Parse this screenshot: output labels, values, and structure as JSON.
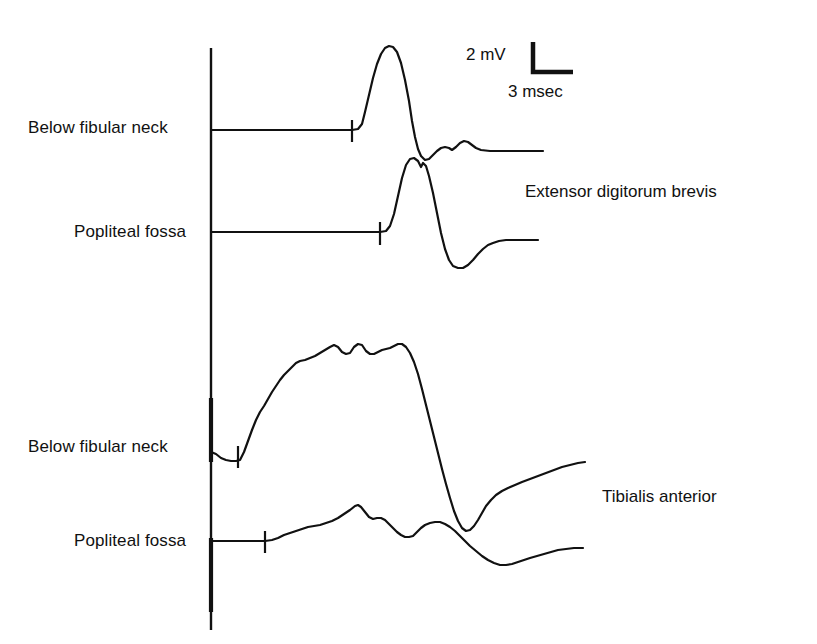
{
  "figure": {
    "type": "electromyography-waveform-figure",
    "background_color": "#ffffff",
    "ink_color": "#111111",
    "width": 817,
    "height": 644
  },
  "scale_bar": {
    "vertical_label": "2 mV",
    "horizontal_label": "3 msec",
    "vertical_amplitude_mV": 2,
    "horizontal_duration_msec": 3,
    "corner_x": 533,
    "corner_y": 72,
    "vertical_top_y": 42,
    "horizontal_right_x": 573
  },
  "axis": {
    "name": "vertical-reference-axis",
    "x": 211,
    "top_y": 48,
    "bottom_y": 630
  },
  "stimulation_site_labels": [
    {
      "text": "Below fibular neck",
      "x": 28,
      "y": 118,
      "trace": 1
    },
    {
      "text": "Popliteal fossa",
      "x": 74,
      "y": 222,
      "trace": 2
    },
    {
      "text": "Below fibular neck",
      "x": 28,
      "y": 437,
      "trace": 3
    },
    {
      "text": "Popliteal fossa",
      "x": 74,
      "y": 531,
      "trace": 4
    }
  ],
  "muscle_labels": [
    {
      "text": "Extensor digitorum brevis",
      "x": 525,
      "y": 182
    },
    {
      "text": "Tibialis anterior",
      "x": 602,
      "y": 487
    }
  ],
  "chart_data": {
    "type": "line",
    "title": "",
    "subtitle": "",
    "xlabel": "Time (msec)",
    "ylabel": "Amplitude (mV)",
    "grid": false,
    "legend_position": "right-inline",
    "axis_note": "Vertical reference line marks stimulus-onset time axis; each trace has its own baseline offset.",
    "calibration": {
      "mV_per_division": 2,
      "msec_per_division": 3
    },
    "series": [
      {
        "name": "Below fibular neck — Extensor digitorum brevis",
        "muscle": "Extensor digitorum brevis",
        "stimulation_site": "Below fibular neck",
        "baseline_y": 130,
        "stimulus_tick_x": 352,
        "stimulus_tick_top_y": 120,
        "stimulus_tick_bottom_y": 142,
        "points": [
          [
            211,
            130
          ],
          [
            250,
            130
          ],
          [
            300,
            130
          ],
          [
            340,
            130
          ],
          [
            352,
            130
          ],
          [
            358,
            129
          ],
          [
            362,
            124
          ],
          [
            365,
            112
          ],
          [
            369,
            95
          ],
          [
            373,
            78
          ],
          [
            377,
            64
          ],
          [
            381,
            54
          ],
          [
            385,
            48
          ],
          [
            389,
            46
          ],
          [
            393,
            47
          ],
          [
            397,
            52
          ],
          [
            401,
            63
          ],
          [
            405,
            80
          ],
          [
            409,
            101
          ],
          [
            412,
            121
          ],
          [
            415,
            137
          ],
          [
            418,
            149
          ],
          [
            421,
            156
          ],
          [
            425,
            160
          ],
          [
            429,
            159
          ],
          [
            433,
            155
          ],
          [
            437,
            151
          ],
          [
            441,
            148
          ],
          [
            445,
            147
          ],
          [
            449,
            148
          ],
          [
            452,
            150
          ],
          [
            456,
            147
          ],
          [
            460,
            143
          ],
          [
            464,
            141
          ],
          [
            468,
            142
          ],
          [
            472,
            145
          ],
          [
            476,
            148
          ],
          [
            481,
            150
          ],
          [
            490,
            151
          ],
          [
            505,
            151
          ],
          [
            520,
            151
          ],
          [
            543,
            151
          ]
        ]
      },
      {
        "name": "Popliteal fossa — Extensor digitorum brevis",
        "muscle": "Extensor digitorum brevis",
        "stimulation_site": "Popliteal fossa",
        "baseline_y": 232,
        "stimulus_tick_x": 380,
        "stimulus_tick_top_y": 222,
        "stimulus_tick_bottom_y": 245,
        "points": [
          [
            211,
            232
          ],
          [
            260,
            232
          ],
          [
            320,
            232
          ],
          [
            370,
            232
          ],
          [
            380,
            232
          ],
          [
            386,
            231
          ],
          [
            390,
            226
          ],
          [
            394,
            214
          ],
          [
            398,
            196
          ],
          [
            402,
            178
          ],
          [
            406,
            165
          ],
          [
            410,
            159
          ],
          [
            414,
            158
          ],
          [
            418,
            161
          ],
          [
            421,
            167
          ],
          [
            423,
            163
          ],
          [
            426,
            166
          ],
          [
            429,
            176
          ],
          [
            433,
            193
          ],
          [
            437,
            213
          ],
          [
            441,
            233
          ],
          [
            445,
            249
          ],
          [
            449,
            260
          ],
          [
            453,
            266
          ],
          [
            458,
            268
          ],
          [
            463,
            268
          ],
          [
            468,
            265
          ],
          [
            473,
            260
          ],
          [
            478,
            254
          ],
          [
            483,
            249
          ],
          [
            488,
            245
          ],
          [
            493,
            243
          ],
          [
            499,
            241
          ],
          [
            506,
            240
          ],
          [
            514,
            240
          ],
          [
            524,
            240
          ],
          [
            538,
            240
          ]
        ]
      },
      {
        "name": "Below fibular neck — Tibialis anterior",
        "muscle": "Tibialis anterior",
        "stimulation_site": "Below fibular neck",
        "baseline_y": 455,
        "stimulus_tick_x": 238,
        "stimulus_tick_top_y": 446,
        "stimulus_tick_bottom_y": 468,
        "points": [
          [
            211,
            452
          ],
          [
            216,
            454
          ],
          [
            221,
            458
          ],
          [
            226,
            460
          ],
          [
            231,
            461
          ],
          [
            236,
            461
          ],
          [
            240,
            460
          ],
          [
            244,
            452
          ],
          [
            248,
            441
          ],
          [
            252,
            430
          ],
          [
            256,
            420
          ],
          [
            260,
            412
          ],
          [
            264,
            406
          ],
          [
            268,
            399
          ],
          [
            272,
            392
          ],
          [
            276,
            386
          ],
          [
            280,
            380
          ],
          [
            284,
            375
          ],
          [
            288,
            371
          ],
          [
            292,
            367
          ],
          [
            296,
            363
          ],
          [
            300,
            361
          ],
          [
            305,
            360
          ],
          [
            310,
            358
          ],
          [
            315,
            356
          ],
          [
            320,
            353
          ],
          [
            325,
            350
          ],
          [
            330,
            347
          ],
          [
            334,
            345
          ],
          [
            338,
            347
          ],
          [
            342,
            352
          ],
          [
            346,
            354
          ],
          [
            350,
            353
          ],
          [
            354,
            347
          ],
          [
            358,
            344
          ],
          [
            362,
            345
          ],
          [
            366,
            351
          ],
          [
            370,
            354
          ],
          [
            374,
            354
          ],
          [
            378,
            352
          ],
          [
            382,
            350
          ],
          [
            386,
            349
          ],
          [
            390,
            348
          ],
          [
            394,
            346
          ],
          [
            398,
            344
          ],
          [
            402,
            344
          ],
          [
            406,
            347
          ],
          [
            410,
            353
          ],
          [
            414,
            362
          ],
          [
            418,
            374
          ],
          [
            422,
            389
          ],
          [
            426,
            405
          ],
          [
            430,
            421
          ],
          [
            434,
            437
          ],
          [
            438,
            453
          ],
          [
            442,
            469
          ],
          [
            446,
            484
          ],
          [
            450,
            498
          ],
          [
            454,
            511
          ],
          [
            458,
            521
          ],
          [
            462,
            528
          ],
          [
            466,
            531
          ],
          [
            470,
            530
          ],
          [
            474,
            526
          ],
          [
            478,
            520
          ],
          [
            482,
            513
          ],
          [
            486,
            506
          ],
          [
            491,
            500
          ],
          [
            496,
            495
          ],
          [
            502,
            491
          ],
          [
            508,
            488
          ],
          [
            515,
            485
          ],
          [
            522,
            482
          ],
          [
            530,
            479
          ],
          [
            538,
            476
          ],
          [
            546,
            473
          ],
          [
            554,
            470
          ],
          [
            562,
            467
          ],
          [
            570,
            465
          ],
          [
            578,
            463
          ],
          [
            585,
            462
          ]
        ]
      },
      {
        "name": "Popliteal fossa — Tibialis anterior",
        "muscle": "Tibialis anterior",
        "stimulation_site": "Popliteal fossa",
        "baseline_y": 541,
        "stimulus_tick_x": 265,
        "stimulus_tick_top_y": 531,
        "stimulus_tick_bottom_y": 553,
        "points": [
          [
            211,
            541
          ],
          [
            230,
            541
          ],
          [
            250,
            541
          ],
          [
            265,
            541
          ],
          [
            272,
            540
          ],
          [
            278,
            538
          ],
          [
            284,
            535
          ],
          [
            290,
            533
          ],
          [
            296,
            531
          ],
          [
            302,
            529
          ],
          [
            308,
            527
          ],
          [
            314,
            526
          ],
          [
            320,
            525
          ],
          [
            326,
            523
          ],
          [
            332,
            521
          ],
          [
            338,
            518
          ],
          [
            344,
            514
          ],
          [
            350,
            510
          ],
          [
            355,
            506
          ],
          [
            358,
            505
          ],
          [
            361,
            507
          ],
          [
            365,
            512
          ],
          [
            369,
            517
          ],
          [
            373,
            519
          ],
          [
            377,
            518
          ],
          [
            381,
            518
          ],
          [
            385,
            520
          ],
          [
            389,
            524
          ],
          [
            393,
            528
          ],
          [
            397,
            532
          ],
          [
            401,
            535
          ],
          [
            405,
            537
          ],
          [
            409,
            537
          ],
          [
            413,
            536
          ],
          [
            417,
            532
          ],
          [
            421,
            528
          ],
          [
            425,
            525
          ],
          [
            430,
            523
          ],
          [
            435,
            522
          ],
          [
            440,
            522
          ],
          [
            445,
            524
          ],
          [
            450,
            527
          ],
          [
            455,
            531
          ],
          [
            460,
            536
          ],
          [
            465,
            541
          ],
          [
            470,
            546
          ],
          [
            476,
            551
          ],
          [
            482,
            556
          ],
          [
            488,
            560
          ],
          [
            494,
            563
          ],
          [
            500,
            565
          ],
          [
            506,
            565
          ],
          [
            512,
            564
          ],
          [
            518,
            562
          ],
          [
            524,
            560
          ],
          [
            530,
            558
          ],
          [
            537,
            556
          ],
          [
            544,
            554
          ],
          [
            551,
            552
          ],
          [
            558,
            550
          ],
          [
            566,
            549
          ],
          [
            574,
            548
          ],
          [
            583,
            548
          ]
        ]
      }
    ]
  }
}
